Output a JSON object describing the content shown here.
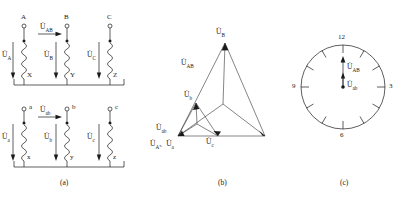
{
  "figure": {
    "title_visible": false,
    "panels": [
      {
        "id": "a",
        "caption": "(a)",
        "description": "transformer winding connection diagram"
      },
      {
        "id": "b",
        "caption": "(b)",
        "description": "phasor diagram"
      },
      {
        "id": "c",
        "caption": "(c)",
        "description": "clock-face vector group diagram"
      }
    ]
  },
  "panel_a": {
    "hv_terminals": [
      "A",
      "B",
      "C"
    ],
    "hv_bottom_terminals": [
      "X",
      "Y",
      "Z"
    ],
    "lv_terminals": [
      "a",
      "b",
      "c"
    ],
    "lv_bottom_terminals": [
      "x",
      "y",
      "z"
    ],
    "hv_voltage_labels": [
      "U̇A",
      "U̇B",
      "U̇C"
    ],
    "lv_voltage_labels": [
      "U̇a",
      "U̇b",
      "U̇c"
    ],
    "hv_line_voltage_label": "U̇AB",
    "lv_line_voltage_label": "U̇ab",
    "voltage_symbols": {
      "UA": {
        "base": "U̇",
        "sub": "A"
      },
      "UB": {
        "base": "U̇",
        "sub": "B"
      },
      "UC": {
        "base": "U̇",
        "sub": "C"
      },
      "Ua": {
        "base": "U̇",
        "sub": "a"
      },
      "Ub": {
        "base": "U̇",
        "sub": "b"
      },
      "Uc": {
        "base": "U̇",
        "sub": "c"
      },
      "UAB": {
        "base": "U̇",
        "sub": "AB"
      },
      "Uab": {
        "base": "U̇",
        "sub": "ab"
      }
    },
    "caption": "(a)"
  },
  "panel_b": {
    "caption": "(b)",
    "labels": {
      "UB": {
        "base": "U̇",
        "sub": "B"
      },
      "UAB": {
        "base": "U̇",
        "sub": "AB"
      },
      "Ub": {
        "base": "U̇",
        "sub": "b"
      },
      "Uab": {
        "base": "U̇",
        "sub": "ab"
      },
      "UA_Ua": {
        "base": "U̇",
        "sub": "A",
        "base2": "U̇",
        "sub2": "a",
        "separator": "、"
      },
      "Uc": {
        "base": "U̇",
        "sub": "c"
      }
    },
    "label_texts": {
      "UB": "U̇B",
      "UAB": "U̇AB",
      "Ub": "U̇b",
      "Uab": "U̇ab",
      "UA_Ua": "U̇A、U̇a",
      "Uc": "U̇c"
    }
  },
  "panel_c": {
    "caption": "(c)",
    "clock_numbers": [
      "12",
      "3",
      "6",
      "9"
    ],
    "hour_marks": 12,
    "hands": [
      {
        "label_base": "U̇",
        "label_sub": "AB",
        "points_to": "12",
        "length": "long"
      },
      {
        "label_base": "U̇",
        "label_sub": "ab",
        "points_to": "12",
        "length": "short"
      }
    ],
    "hand_labels": {
      "UAB": "U̇AB",
      "Uab": "U̇ab"
    }
  },
  "colors": {
    "ink": "#1a1a1a",
    "line": "#2a2a2a",
    "background": "#ffffff"
  }
}
